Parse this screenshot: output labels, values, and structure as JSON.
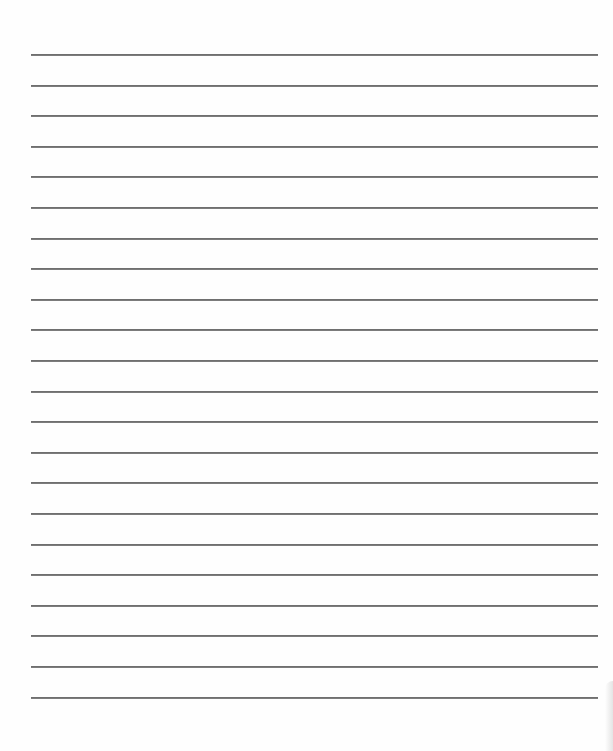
{
  "document": {
    "type": "lined-paper",
    "line_count": 22,
    "first_line_y": 54,
    "line_spacing": 30.6,
    "line_left": 31,
    "line_right": 598,
    "colors": {
      "paper": "#fefefe",
      "rule": "#6f6f6f"
    },
    "lines": [
      "",
      "",
      "",
      "",
      "",
      "",
      "",
      "",
      "",
      "",
      "",
      "",
      "",
      "",
      "",
      "",
      "",
      "",
      "",
      "",
      "",
      ""
    ]
  }
}
